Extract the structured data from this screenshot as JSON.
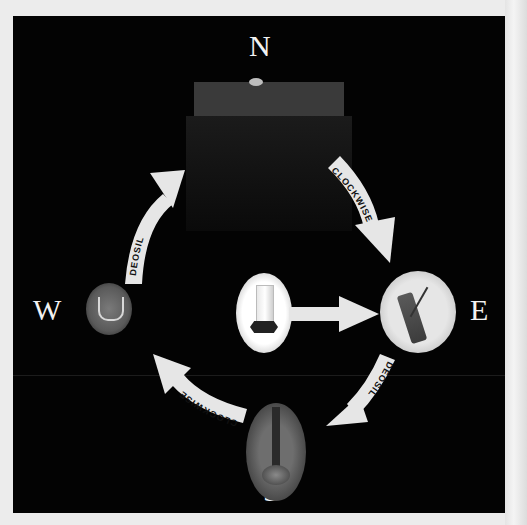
{
  "diagram": {
    "directions": {
      "north": {
        "label": "N",
        "object": "altar-table-with-stone"
      },
      "east": {
        "label": "E",
        "object": "incense-burner"
      },
      "south": {
        "label": "S",
        "object": "tall-candle"
      },
      "west": {
        "label": "W",
        "object": "water-chalice"
      }
    },
    "center": {
      "object": "lit-candle-in-holder"
    },
    "arrows": [
      {
        "from": "north",
        "to": "east",
        "label": "CLOCKWISE"
      },
      {
        "from": "east",
        "to": "south",
        "label": "DEOSIL"
      },
      {
        "from": "south",
        "to": "west",
        "label": "CLOCKWISE"
      },
      {
        "from": "west",
        "to": "north",
        "label": "DEOSIL"
      },
      {
        "from": "center",
        "to": "east",
        "label": ""
      }
    ],
    "colors": {
      "background": "#030303",
      "page": "#ececec",
      "arrow_fill": "#e6e6e6",
      "arrow_text": "#111111",
      "label_text": "#f2f2f2"
    }
  }
}
